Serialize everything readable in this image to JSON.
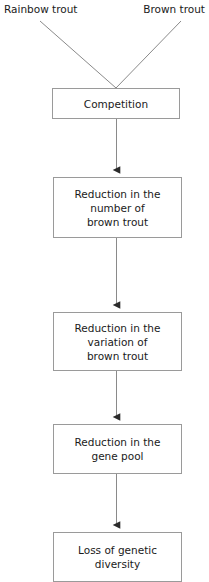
{
  "diagram": {
    "type": "flowchart",
    "orientation": "top-to-bottom",
    "colors": {
      "box_border": "#9a9a9a",
      "connector_line": "#8a8a8a",
      "arrowhead": "#2b2b2b",
      "text": "#1a1a1a",
      "background": "#ffffff"
    },
    "sources": [
      {
        "id": "rainbow-trout",
        "label": "Rainbow trout"
      },
      {
        "id": "brown-trout",
        "label": "Brown trout"
      }
    ],
    "nodes": [
      {
        "id": "competition",
        "label": "Competition"
      },
      {
        "id": "reduction-number",
        "label": "Reduction in the\nnumber of\nbrown trout"
      },
      {
        "id": "reduction-variation",
        "label": "Reduction in the\nvariation of\nbrown trout"
      },
      {
        "id": "reduction-genepool",
        "label": "Reduction in the\ngene pool"
      },
      {
        "id": "loss-diversity",
        "label": "Loss of genetic\ndiversity"
      }
    ],
    "edges": [
      {
        "from": "rainbow-trout",
        "to": "competition",
        "style": "diagonal-line",
        "arrowhead": false
      },
      {
        "from": "brown-trout",
        "to": "competition",
        "style": "diagonal-line",
        "arrowhead": false
      },
      {
        "from": "competition",
        "to": "reduction-number",
        "style": "vertical-line",
        "arrowhead": true
      },
      {
        "from": "reduction-number",
        "to": "reduction-variation",
        "style": "vertical-line",
        "arrowhead": true
      },
      {
        "from": "reduction-variation",
        "to": "reduction-genepool",
        "style": "vertical-line",
        "arrowhead": true
      },
      {
        "from": "reduction-genepool",
        "to": "loss-diversity",
        "style": "vertical-line",
        "arrowhead": true
      }
    ]
  }
}
